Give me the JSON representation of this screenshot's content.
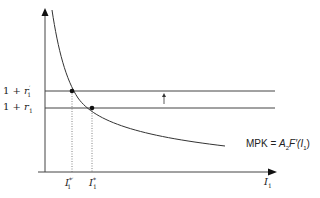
{
  "diagram": {
    "y_labels": {
      "upper_prefix": "1 + ",
      "upper_var": "r",
      "upper_sub": "1",
      "upper_mark": "′",
      "lower_prefix": "1 + ",
      "lower_var": "r",
      "lower_sub": "1"
    },
    "x_labels": {
      "left_var": "I",
      "left_sub": "1",
      "left_mark": "*′",
      "right_var": "I",
      "right_sub": "1",
      "right_mark": "*",
      "axis_var": "I",
      "axis_sub": "1"
    },
    "curve_label": {
      "prefix": "MPK = ",
      "a": "A",
      "a_sub": "2",
      "f": "F′(",
      "i": "I",
      "i_sub": "1",
      "close": ")"
    },
    "shift_arrow": "↑",
    "colors": {
      "line": "#333333",
      "dotted": "#666666"
    }
  }
}
